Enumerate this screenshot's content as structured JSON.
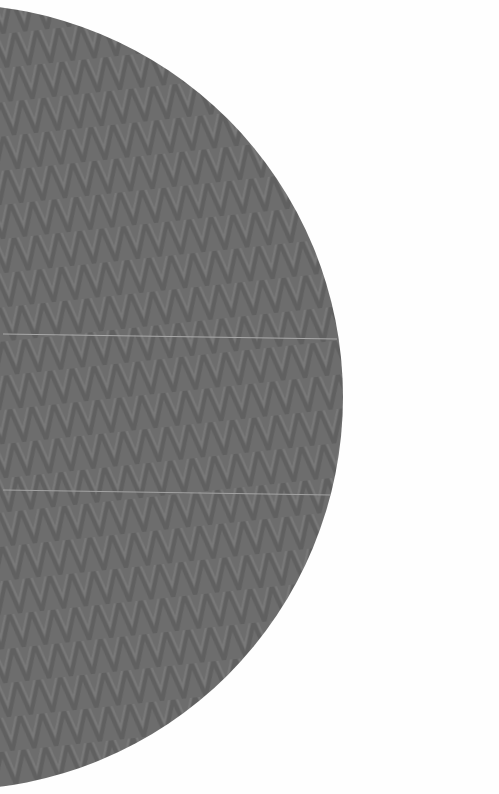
{
  "scene": {
    "width": 499,
    "height": 794,
    "background_color": "#fefefe",
    "subject": "gray half-disc surface with zigzag moire texture",
    "shape": {
      "type": "semicircle",
      "center_x": -50,
      "center_y": 397,
      "radius": 393,
      "fill_color": "#6d6d6d",
      "stripe_dark": "#626262",
      "stripe_light": "#7a7a7a"
    },
    "seams": [
      {
        "x1": 3,
        "y1": 334,
        "x2": 337,
        "y2": 339,
        "color": "#a9a9a9"
      },
      {
        "x1": 3,
        "y1": 490,
        "x2": 331,
        "y2": 495,
        "color": "#a3a3a3"
      }
    ]
  }
}
